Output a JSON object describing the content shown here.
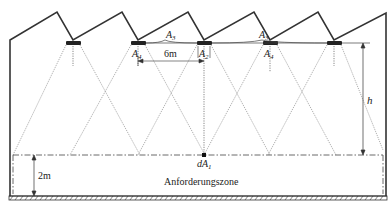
{
  "diagram": {
    "type": "lighting-layout-cross-section",
    "labels": {
      "A3_left": "A",
      "A3_left_sub": "3",
      "A3_right": "A",
      "A3_right_sub": "3",
      "A4_left": "A",
      "A4_left_sub": "4",
      "A4_right": "A",
      "A4_right_sub": "4",
      "A2": "A",
      "A2_sub": "2",
      "spacing": "6m",
      "height": "h",
      "zone_height": "2m",
      "point": "dA",
      "point_sub": "1",
      "zone": "Anforderungszone"
    },
    "luminaires": [
      {
        "x": 73
      },
      {
        "x": 138
      },
      {
        "x": 204
      },
      {
        "x": 270
      },
      {
        "x": 334
      }
    ],
    "colors": {
      "structure": "#333333",
      "lines": "#555555",
      "background": "#ffffff"
    }
  }
}
